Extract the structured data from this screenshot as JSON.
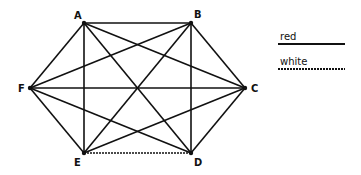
{
  "diagram": {
    "type": "complete-graph-K6",
    "vertices": [
      {
        "id": "A",
        "x": 84,
        "y": 23,
        "label_x": 74,
        "label_y": 19
      },
      {
        "id": "B",
        "x": 191,
        "y": 23,
        "label_x": 194,
        "label_y": 18
      },
      {
        "id": "C",
        "x": 245,
        "y": 88,
        "label_x": 251,
        "label_y": 92
      },
      {
        "id": "D",
        "x": 191,
        "y": 153,
        "label_x": 194,
        "label_y": 166
      },
      {
        "id": "E",
        "x": 84,
        "y": 153,
        "label_x": 74,
        "label_y": 166
      },
      {
        "id": "F",
        "x": 30,
        "y": 88,
        "label_x": 18,
        "label_y": 92
      }
    ],
    "edges": [
      {
        "from": "A",
        "to": "B",
        "color": "red"
      },
      {
        "from": "A",
        "to": "C",
        "color": "red"
      },
      {
        "from": "A",
        "to": "D",
        "color": "red"
      },
      {
        "from": "A",
        "to": "E",
        "color": "red"
      },
      {
        "from": "A",
        "to": "F",
        "color": "red"
      },
      {
        "from": "B",
        "to": "C",
        "color": "red"
      },
      {
        "from": "B",
        "to": "D",
        "color": "red"
      },
      {
        "from": "B",
        "to": "E",
        "color": "red"
      },
      {
        "from": "B",
        "to": "F",
        "color": "red"
      },
      {
        "from": "C",
        "to": "D",
        "color": "red"
      },
      {
        "from": "C",
        "to": "E",
        "color": "red"
      },
      {
        "from": "C",
        "to": "F",
        "color": "red"
      },
      {
        "from": "D",
        "to": "E",
        "color": "white"
      },
      {
        "from": "D",
        "to": "F",
        "color": "red"
      },
      {
        "from": "E",
        "to": "F",
        "color": "red"
      }
    ],
    "legend": [
      {
        "label": "red",
        "style": "solid"
      },
      {
        "label": "white",
        "style": "dashed"
      }
    ]
  }
}
